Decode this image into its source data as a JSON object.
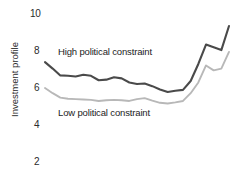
{
  "chart_data": {
    "type": "line",
    "title": "",
    "xlabel": "",
    "ylabel": "Investment profile",
    "ylim": [
      1,
      10.6
    ],
    "yticks": [
      10,
      8,
      6,
      4,
      2
    ],
    "ytick_labels": [
      "10",
      "8",
      "6",
      "4",
      "2"
    ],
    "xlim": [
      0,
      24
    ],
    "grid": false,
    "legend_position": "inline-annotations",
    "series": [
      {
        "name": "High political constraint",
        "color": "#4a4a4a",
        "x": [
          0,
          1,
          2,
          3,
          4,
          5,
          6,
          7,
          8,
          9,
          10,
          11,
          12,
          13,
          14,
          15,
          16,
          17,
          18,
          19,
          20,
          21,
          22,
          23,
          24
        ],
        "values": [
          7.4,
          7.05,
          6.68,
          6.66,
          6.62,
          6.72,
          6.66,
          6.42,
          6.45,
          6.58,
          6.52,
          6.3,
          6.22,
          6.24,
          6.1,
          5.92,
          5.78,
          5.85,
          5.9,
          6.38,
          7.3,
          8.35,
          8.2,
          8.05,
          9.35
        ]
      },
      {
        "name": "Low political constraint",
        "color": "#b8b8b8",
        "x": [
          0,
          1,
          2,
          3,
          4,
          5,
          6,
          7,
          8,
          9,
          10,
          11,
          12,
          13,
          14,
          15,
          16,
          17,
          18,
          19,
          20,
          21,
          22,
          23,
          24
        ],
        "values": [
          6.0,
          5.72,
          5.48,
          5.42,
          5.4,
          5.38,
          5.36,
          5.3,
          5.34,
          5.36,
          5.34,
          5.3,
          5.4,
          5.45,
          5.32,
          5.2,
          5.16,
          5.22,
          5.3,
          5.72,
          6.3,
          7.22,
          6.95,
          7.05,
          7.95
        ]
      }
    ],
    "annotations": [
      {
        "text": "High political constraint",
        "x_px": 58,
        "y_px": 51
      },
      {
        "text": "Low political constraint",
        "x_px": 58,
        "y_px": 107
      }
    ]
  }
}
